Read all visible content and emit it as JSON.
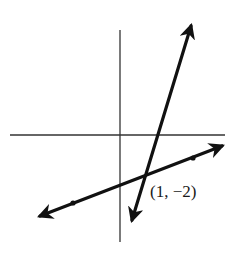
{
  "figure": {
    "colors": {
      "background": "#ffffff",
      "axes": "#333333",
      "lines": "#111111",
      "label": "#1a1a1a"
    },
    "axes": {
      "x_axis": {
        "x1": 10,
        "y1": 135,
        "x2": 225,
        "y2": 135
      },
      "y_axis": {
        "x1": 120,
        "y1": 30,
        "x2": 120,
        "y2": 242
      }
    },
    "lines": [
      {
        "name": "steep-line",
        "x1": 132,
        "y1": 220,
        "x2": 191,
        "y2": 26,
        "arrows": "both"
      },
      {
        "name": "shallow-line",
        "x1": 40,
        "y1": 216,
        "x2": 222,
        "y2": 146,
        "arrows": "both"
      }
    ],
    "dots": [
      {
        "name": "shallow-line-dot-left",
        "cx": 73,
        "cy": 203
      },
      {
        "name": "shallow-line-dot-right",
        "cx": 193,
        "cy": 158
      }
    ],
    "intersection": {
      "cx": 144,
      "cy": 176,
      "label": "(1, −2)",
      "label_x": 150,
      "label_y": 197
    }
  }
}
